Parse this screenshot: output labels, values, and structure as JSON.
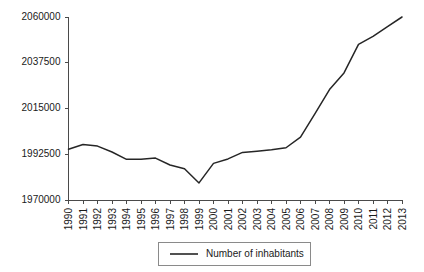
{
  "chart_data": {
    "type": "line",
    "title": "",
    "xlabel": "",
    "ylabel": "",
    "grid": false,
    "legend_position": "bottom",
    "x": [
      1990,
      1991,
      1992,
      1993,
      1994,
      1995,
      1996,
      1997,
      1998,
      1999,
      2000,
      2001,
      2002,
      2003,
      2004,
      2005,
      2006,
      2007,
      2008,
      2009,
      2010,
      2011,
      2012,
      2013
    ],
    "categories": [
      "1990",
      "1991",
      "1992",
      "1993",
      "1994",
      "1995",
      "1996",
      "1997",
      "1998",
      "1999",
      "2000",
      "2001",
      "2002",
      "2003",
      "2004",
      "2005",
      "2006",
      "2007",
      "2008",
      "2009",
      "2010",
      "2011",
      "2012",
      "2013"
    ],
    "series": [
      {
        "name": "Number of inhabitants",
        "color": "#262626",
        "values": [
          1995000,
          1997300,
          1996500,
          1993600,
          1990000,
          1990000,
          1990600,
          1987200,
          1985400,
          1978400,
          1988000,
          1990200,
          1993400,
          1994000,
          1994700,
          1995700,
          2000900,
          2012500,
          2024300,
          2032500,
          2046500,
          2050500,
          2055300,
          2060000
        ]
      }
    ],
    "ylim": [
      1970000,
      2060000
    ],
    "yticks": [
      1970000,
      1992500,
      2015000,
      2037500,
      2060000
    ],
    "ytick_labels": [
      "1970000",
      "1992500",
      "2015000",
      "2037500",
      "2060000"
    ],
    "xlim": [
      1990,
      2013
    ],
    "xticks": [
      1990,
      1991,
      1992,
      1993,
      1994,
      1995,
      1996,
      1997,
      1998,
      1999,
      2000,
      2001,
      2002,
      2003,
      2004,
      2005,
      2006,
      2007,
      2008,
      2009,
      2010,
      2011,
      2012,
      2013
    ]
  },
  "legend": {
    "entries": [
      {
        "label": "Number of inhabitants",
        "color": "#262626"
      }
    ]
  },
  "colors": {
    "series": "#262626",
    "axis": "#4a4a4a",
    "legend_border": "#8a8a8a",
    "background": "#ffffff",
    "text": "#1a1a1a"
  }
}
